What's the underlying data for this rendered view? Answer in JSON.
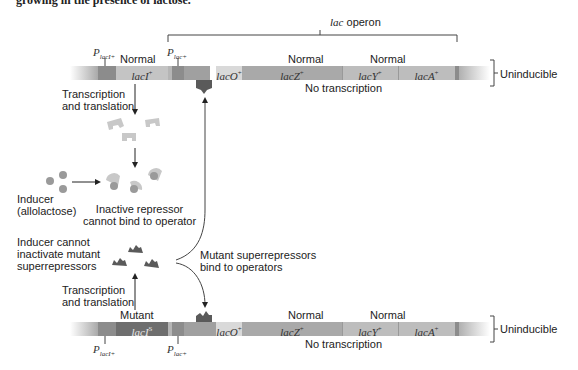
{
  "heading": "growing in the presence of lactose.",
  "operon_label": {
    "italic": "lac",
    "rest": " operon"
  },
  "top_strand": {
    "promoters": [
      {
        "base": "P",
        "sub": "lacI+"
      },
      {
        "base": "P",
        "sub": "lac+"
      }
    ],
    "status_labels": [
      "Normal",
      "Normal",
      "Normal"
    ],
    "genes": [
      {
        "name": "lacI",
        "sup": "+"
      },
      {
        "name": "lacO",
        "sup": "+"
      },
      {
        "name": "lacZ",
        "sup": "+"
      },
      {
        "name": "lacY",
        "sup": "+"
      },
      {
        "name": "lacA",
        "sup": "+"
      }
    ],
    "no_transcription": "No transcription",
    "result": "Uninducible"
  },
  "bottom_strand": {
    "promoters": [
      {
        "base": "P",
        "sub": "lacI+"
      },
      {
        "base": "P",
        "sub": "lac+"
      }
    ],
    "status_labels": [
      "Mutant",
      "Normal",
      "Normal"
    ],
    "genes": [
      {
        "name": "lacI",
        "sup": "S"
      },
      {
        "name": "lacO",
        "sup": "+"
      },
      {
        "name": "lacZ",
        "sup": "+"
      },
      {
        "name": "lacY",
        "sup": "+"
      },
      {
        "name": "lacA",
        "sup": "+"
      }
    ],
    "no_transcription": "No transcription",
    "result": "Uninducible"
  },
  "steps": {
    "transcription_top": [
      "Transcription",
      "and translation"
    ],
    "inducer": [
      "Inducer",
      "(allolactose)"
    ],
    "inactive_repressor": [
      "Inactive repressor",
      "cannot bind to operator"
    ],
    "inducer_cannot": [
      "Inducer cannot",
      "inactivate mutant",
      "superrepressors"
    ],
    "mutant_bind": [
      "Mutant superrepressors",
      "bind to operators"
    ],
    "transcription_bottom": [
      "Transcription",
      "and translation"
    ]
  },
  "colors": {
    "bar_dark": "#8c8c8c",
    "bar_mid": "#a9a9a9",
    "bar_light": "#c4c4c4",
    "operator": "#d9d9d9",
    "mutant_gene": "#6e6e6e",
    "repressor_normal": "#c8c8c8",
    "repressor_mutant": "#5a5a5a",
    "inducer": "#9a9a9a"
  }
}
